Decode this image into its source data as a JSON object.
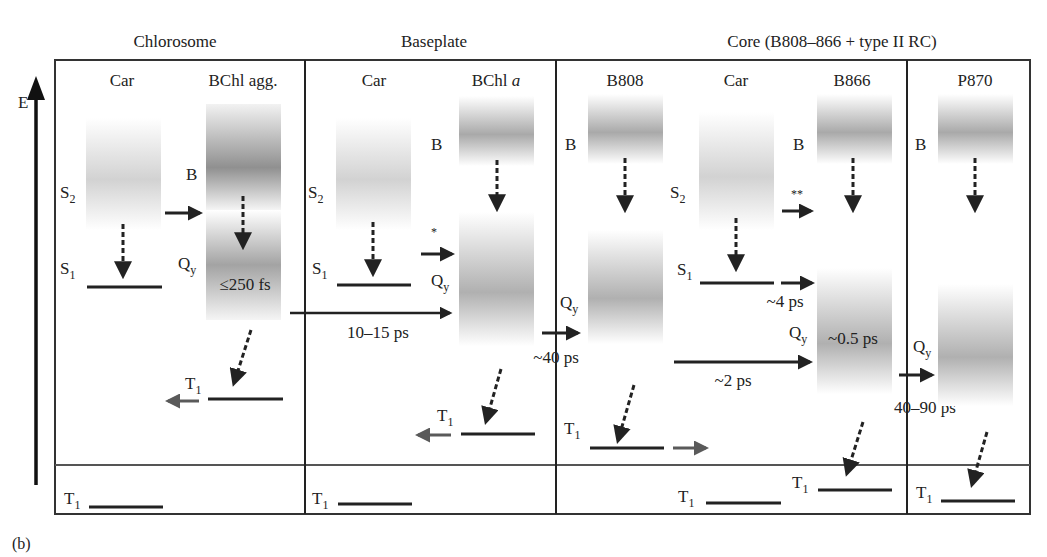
{
  "figure_label": "(b)",
  "axis": {
    "label": "E"
  },
  "sections": [
    {
      "title": "Chlorosome"
    },
    {
      "title": "Baseplate"
    },
    {
      "title": "Core (B808–866 + type II RC)"
    }
  ],
  "columns": {
    "chlorosome_car": "Car",
    "chlorosome_bchl": "BChl agg.",
    "baseplate_car": "Car",
    "baseplate_bchl": "BChl",
    "baseplate_bchl_italic": "a",
    "core_b808": "B808",
    "core_car": "Car",
    "core_b866": "B866",
    "rc_p870": "P870"
  },
  "levels": {
    "S2": "S",
    "S2_sub": "2",
    "S1": "S",
    "S1_sub": "1",
    "T1": "T",
    "T1_sub": "1",
    "Qy": "Q",
    "Qy_sub": "y",
    "B": "B"
  },
  "timescales": {
    "chlorosome_b_to_qy": "≤250 fs",
    "chlorosome_to_baseplate": "10–15 ps",
    "baseplate_to_b808": "~40 ps",
    "car_s1_to_b866": "~4 ps",
    "b866_internal": "~0.5 ps",
    "b808_to_b866": "~2 ps",
    "b866_to_p870": "40–90 ps"
  },
  "markers": {
    "baseplate_car_transfer": "*",
    "core_car_s2_transfer": "**"
  },
  "colors": {
    "line": "#222222",
    "grey_arrow": "#5a5a5a",
    "band_dark": "#9a9a9a",
    "band_mid": "#b4b4b4",
    "band_light": "#cfcfcf"
  }
}
